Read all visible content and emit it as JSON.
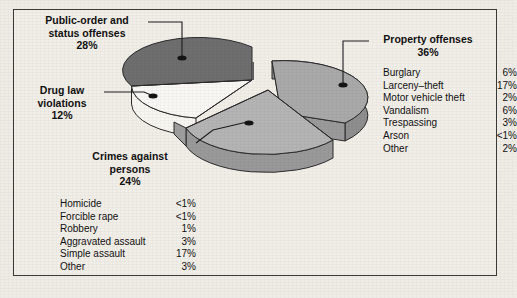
{
  "chart_data": {
    "type": "pie",
    "title": "",
    "categories": [
      "Property offenses",
      "Public-order and status offenses",
      "Crimes against persons",
      "Drug law violations"
    ],
    "values": [
      36,
      28,
      24,
      12
    ],
    "value_labels": [
      "36%",
      "28%",
      "24%",
      "12%"
    ],
    "legend_position": "callout-labels",
    "grid": false,
    "colors": {
      "property_offenses": "#a9a9a9",
      "public_order": "#6e6e6e",
      "crimes_against_persons": "#b4b4b4",
      "drug_law": "#f7f5f0",
      "outline": "#2b2b2b",
      "background": "#f1eee8",
      "text": "#111111"
    },
    "breakdowns": [
      {
        "parent": "Property offenses",
        "items": [
          {
            "label": "Burglary",
            "value": "6%"
          },
          {
            "label": "Larceny–theft",
            "value": "17%"
          },
          {
            "label": "Motor vehicle theft",
            "value": "2%"
          },
          {
            "label": "Vandalism",
            "value": "6%"
          },
          {
            "label": "Trespassing",
            "value": "3%"
          },
          {
            "label": "Arson",
            "value": "<1%"
          },
          {
            "label": "Other",
            "value": "2%"
          }
        ]
      },
      {
        "parent": "Crimes against persons",
        "items": [
          {
            "label": "Homicide",
            "value": "<1%"
          },
          {
            "label": "Forcible rape",
            "value": "<1%"
          },
          {
            "label": "Robbery",
            "value": "1%"
          },
          {
            "label": "Aggravated assault",
            "value": "3%"
          },
          {
            "label": "Simple assault",
            "value": "17%"
          },
          {
            "label": "Other",
            "value": "3%"
          }
        ]
      }
    ]
  },
  "labels": {
    "public_order": {
      "line1": "Public-order and",
      "line2": "status offenses",
      "pct": "28%"
    },
    "drug_law": {
      "line1": "Drug law",
      "line2": "violations",
      "pct": "12%"
    },
    "crimes_persons": {
      "line1": "Crimes against",
      "line2": "persons",
      "pct": "24%"
    },
    "property": {
      "line1": "Property offenses",
      "pct": "36%"
    }
  },
  "legend_property": {
    "rows": [
      {
        "name": "Burglary",
        "value": "6%"
      },
      {
        "name": "Larceny–theft",
        "value": "17%"
      },
      {
        "name": "Motor vehicle theft",
        "value": "2%"
      },
      {
        "name": "Vandalism",
        "value": "6%"
      },
      {
        "name": "Trespassing",
        "value": "3%"
      },
      {
        "name": "Arson",
        "value": "<1%"
      },
      {
        "name": "Other",
        "value": "2%"
      }
    ]
  },
  "legend_persons": {
    "rows": [
      {
        "name": "Homicide",
        "value": "<1%"
      },
      {
        "name": "Forcible rape",
        "value": "<1%"
      },
      {
        "name": "Robbery",
        "value": "1%"
      },
      {
        "name": "Aggravated assault",
        "value": "3%"
      },
      {
        "name": "Simple assault",
        "value": "17%"
      },
      {
        "name": "Other",
        "value": "3%"
      }
    ]
  }
}
